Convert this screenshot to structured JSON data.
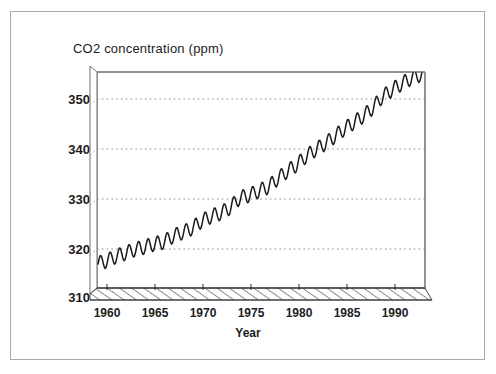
{
  "figure": {
    "title": "CO2 concentration (ppm)",
    "xlabel": "Year",
    "frame_color": "#a8a8a8",
    "line_color": "#1a1a1a",
    "grid_color": "#999999",
    "floor_color": "#555555"
  },
  "chart_data": {
    "type": "line",
    "title": "CO2 concentration (ppm)",
    "subtitle": "",
    "xlabel": "Year",
    "ylabel": "CO2 concentration (ppm)",
    "xlim": [
      1958,
      1992.5
    ],
    "ylim": [
      310,
      357
    ],
    "grid": true,
    "grid_axis": "y",
    "grid_style": "dotted",
    "legend": "none",
    "projection": "3d-box",
    "xticks": [
      1960,
      1965,
      1970,
      1975,
      1980,
      1985,
      1990
    ],
    "xticklabels": [
      "1960",
      "1965",
      "1970",
      "1975",
      "1980",
      "1985",
      "1990"
    ],
    "yticks": [
      310,
      320,
      330,
      340,
      350
    ],
    "yticklabels": [
      "310",
      "320",
      "330",
      "340",
      "350"
    ],
    "gridlines": [
      320,
      330,
      340,
      350
    ],
    "series": [
      {
        "name": "Mauna Loa monthly mean CO2",
        "seasonal_amplitude_ppm": 3.1,
        "seasonal_peak_month": 5,
        "seasonal_trough_month": 9,
        "annual_means": {
          "1958": 315.3,
          "1959": 315.9,
          "1960": 316.9,
          "1961": 317.6,
          "1962": 318.4,
          "1963": 318.9,
          "1964": 319.6,
          "1965": 320.0,
          "1966": 321.3,
          "1967": 322.1,
          "1968": 323.0,
          "1969": 324.6,
          "1970": 325.6,
          "1971": 326.3,
          "1972": 327.5,
          "1973": 329.6,
          "1974": 330.2,
          "1975": 331.1,
          "1976": 332.0,
          "1977": 333.8,
          "1978": 335.4,
          "1979": 336.8,
          "1980": 338.7,
          "1981": 340.1,
          "1982": 341.4,
          "1983": 343.0,
          "1984": 344.6,
          "1985": 346.0,
          "1986": 347.4,
          "1987": 349.2,
          "1988": 351.6,
          "1989": 353.1,
          "1990": 354.4,
          "1991": 355.6,
          "1992": 356.4
        },
        "x_start": 1958.1,
        "x_end": 1992.4,
        "y_min_observed": 313.2,
        "y_max_observed": 357.0
      }
    ]
  }
}
